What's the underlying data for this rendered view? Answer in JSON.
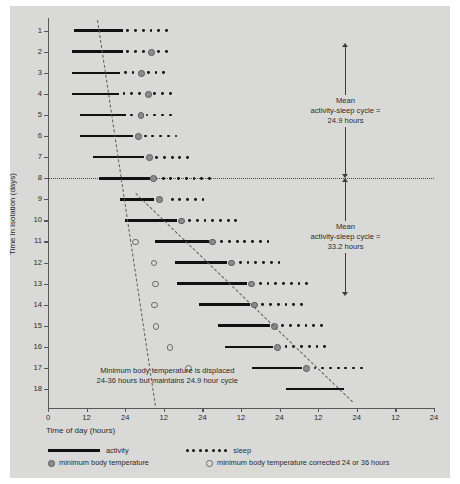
{
  "chart_data": {
    "type": "scatter",
    "title": "",
    "xlabel": "Time of day (hours)",
    "ylabel": "Time in isolation (days)",
    "xlim": [
      0,
      120
    ],
    "ylim": [
      0.4,
      18.9
    ],
    "x_tick_values": [
      0,
      12,
      24,
      36,
      48,
      60,
      72,
      84,
      96,
      108,
      120
    ],
    "x_tick_labels": [
      "0",
      "12",
      "24",
      "12",
      "24",
      "12",
      "24",
      "12",
      "24",
      "12",
      "24"
    ],
    "y_tick_labels": [
      "1",
      "2",
      "3",
      "4",
      "5",
      "6",
      "7",
      "8",
      "9",
      "10",
      "11",
      "12",
      "13",
      "14",
      "15",
      "16",
      "17",
      "18"
    ],
    "grid": false,
    "legend_position": "below-axis",
    "series": [
      {
        "name": "activity",
        "type": "bar-span",
        "marker": "thick-black-line",
        "spans": [
          {
            "day": 1,
            "start": 8.2,
            "end": 23.3
          },
          {
            "day": 2,
            "start": 7.4,
            "end": 23.3
          },
          {
            "day": 3,
            "start": 7.4,
            "end": 22.5
          },
          {
            "day": 4,
            "start": 7.4,
            "end": 22.1
          },
          {
            "day": 5,
            "start": 10.1,
            "end": 24.4
          },
          {
            "day": 6,
            "start": 10.1,
            "end": 26.3
          },
          {
            "day": 7,
            "start": 14.0,
            "end": 29.8
          },
          {
            "day": 8,
            "start": 16.0,
            "end": 31.8
          },
          {
            "day": 9,
            "start": 22.4,
            "end": 32.9
          },
          {
            "day": 10,
            "start": 24.0,
            "end": 40.0
          },
          {
            "day": 11,
            "start": 33.3,
            "end": 50.0
          },
          {
            "day": 12,
            "start": 39.5,
            "end": 55.8
          },
          {
            "day": 13,
            "start": 40.0,
            "end": 62.0
          },
          {
            "day": 14,
            "start": 47.0,
            "end": 62.8
          },
          {
            "day": 15,
            "start": 53.0,
            "end": 69.0
          },
          {
            "day": 16,
            "start": 55.0,
            "end": 70.0
          },
          {
            "day": 17,
            "start": 63.5,
            "end": 79.0
          },
          {
            "day": 18,
            "start": 74.0,
            "end": 92.0
          }
        ]
      },
      {
        "name": "sleep",
        "type": "dot-span",
        "marker": "small-filled-dot",
        "rows": [
          {
            "day": 1,
            "dots": [
              24.8,
              27.2,
              29.6,
              32.0,
              34.4,
              36.8
            ]
          },
          {
            "day": 2,
            "dots": [
              24.8,
              27.2,
              29.6,
              32.0,
              34.4,
              36.8
            ]
          },
          {
            "day": 3,
            "dots": [
              24.0,
              26.4,
              28.8,
              31.2,
              33.6,
              36.0
            ]
          },
          {
            "day": 4,
            "dots": [
              23.6,
              26.0,
              28.4,
              30.8,
              33.2,
              35.6,
              38.0
            ]
          },
          {
            "day": 5,
            "dots": [
              26.0,
              28.4,
              30.8,
              33.2,
              35.6,
              38.0
            ]
          },
          {
            "day": 6,
            "dots": [
              27.8,
              30.2,
              32.6,
              35.0,
              37.4,
              39.8
            ]
          },
          {
            "day": 7,
            "dots": [
              31.4,
              33.8,
              36.2,
              38.6,
              41.0,
              43.4
            ]
          },
          {
            "day": 8,
            "dots": [
              33.4,
              35.8,
              38.2,
              40.6,
              43.0,
              45.4,
              47.8,
              50.2
            ]
          },
          {
            "day": 9,
            "dots": [
              34.6,
              38.6,
              41.0,
              43.4,
              45.8,
              48.2
            ]
          },
          {
            "day": 10,
            "dots": [
              41.6,
              44.0,
              46.4,
              48.8,
              51.2,
              53.6,
              56.0,
              58.4
            ]
          },
          {
            "day": 11,
            "dots": [
              51.6,
              54.0,
              56.4,
              58.8,
              61.2,
              63.6,
              66.0,
              68.4
            ]
          },
          {
            "day": 12,
            "dots": [
              57.4,
              59.8,
              62.2,
              64.6,
              67.0,
              69.4,
              71.8
            ]
          },
          {
            "day": 13,
            "dots": [
              63.6,
              66.0,
              68.4,
              70.8,
              73.2,
              75.6,
              78.0,
              80.4
            ]
          },
          {
            "day": 14,
            "dots": [
              64.4,
              66.8,
              69.2,
              71.6,
              74.0,
              76.4,
              78.8
            ]
          },
          {
            "day": 15,
            "dots": [
              70.6,
              73.0,
              75.4,
              77.8,
              80.2,
              82.6,
              85.0
            ]
          },
          {
            "day": 16,
            "dots": [
              71.6,
              74.0,
              76.4,
              78.8,
              81.2,
              83.6,
              86.0
            ]
          },
          {
            "day": 17,
            "dots": [
              80.6,
              83.0,
              85.4,
              87.8,
              90.2,
              92.6,
              95.0,
              97.4
            ]
          },
          {
            "day": 18,
            "dots": []
          }
        ]
      },
      {
        "name": "minimum body temperature",
        "type": "scatter",
        "marker": "filled-gray-circle",
        "points": [
          {
            "day": 2,
            "x": 32.0
          },
          {
            "day": 3,
            "x": 29.0
          },
          {
            "day": 4,
            "x": 31.0
          },
          {
            "day": 5,
            "x": 28.8
          },
          {
            "day": 6,
            "x": 28.0
          },
          {
            "day": 7,
            "x": 31.4
          },
          {
            "day": 8,
            "x": 32.6
          },
          {
            "day": 9,
            "x": 34.6
          },
          {
            "day": 10,
            "x": 41.4
          },
          {
            "day": 11,
            "x": 51.0
          },
          {
            "day": 12,
            "x": 56.8
          },
          {
            "day": 13,
            "x": 63.2
          },
          {
            "day": 14,
            "x": 64.0
          },
          {
            "day": 15,
            "x": 70.2
          },
          {
            "day": 16,
            "x": 71.2
          },
          {
            "day": 17,
            "x": 80.2
          }
        ]
      },
      {
        "name": "minimum body temperature corrected 24 or 36 hours",
        "type": "scatter",
        "marker": "open-circle",
        "points": [
          {
            "day": 11,
            "x": 27.0
          },
          {
            "day": 12,
            "x": 32.8
          },
          {
            "day": 13,
            "x": 33.2
          },
          {
            "day": 14,
            "x": 33.0
          },
          {
            "day": 15,
            "x": 33.4
          },
          {
            "day": 16,
            "x": 37.8
          },
          {
            "day": 17,
            "x": 43.6
          }
        ]
      }
    ],
    "reference_lines": [
      {
        "name": "day-8-dotted-line",
        "orientation": "horizontal",
        "day": 8,
        "style": "dotted"
      },
      {
        "name": "activity-onset-trend-early",
        "orientation": "diagonal",
        "style": "dashed"
      },
      {
        "name": "activity-onset-trend-late",
        "orientation": "diagonal",
        "style": "dashed"
      }
    ],
    "annotations": [
      {
        "name": "mean-cycle-upper",
        "line1": "Mean",
        "line2": "activity-sleep cycle =",
        "line3": "24.9 hours",
        "value": 24.9,
        "units": "hours",
        "span_days": [
          1,
          8
        ]
      },
      {
        "name": "mean-cycle-lower",
        "line1": "Mean",
        "line2": "activity-sleep cycle =",
        "line3": "33.2 hours",
        "value": 33.2,
        "units": "hours",
        "span_days": [
          8,
          14
        ]
      },
      {
        "name": "temperature-note",
        "line1": "Minimum body temperature is displaced",
        "line2": "24-36 hours but maintains 24.9 hour cycle"
      }
    ]
  },
  "legend": {
    "activity_label": "activity",
    "sleep_label": "sleep",
    "mbt_label": "minimum body temperature",
    "mbt_corrected_label": "minimum body temperature corrected 24 or 36 hours"
  },
  "colors": {
    "background": "#d9d9d7",
    "ink": "#111113",
    "axis": "#58585a",
    "gray_marker": "#8c8c8e",
    "text": "#2b2b2d"
  }
}
